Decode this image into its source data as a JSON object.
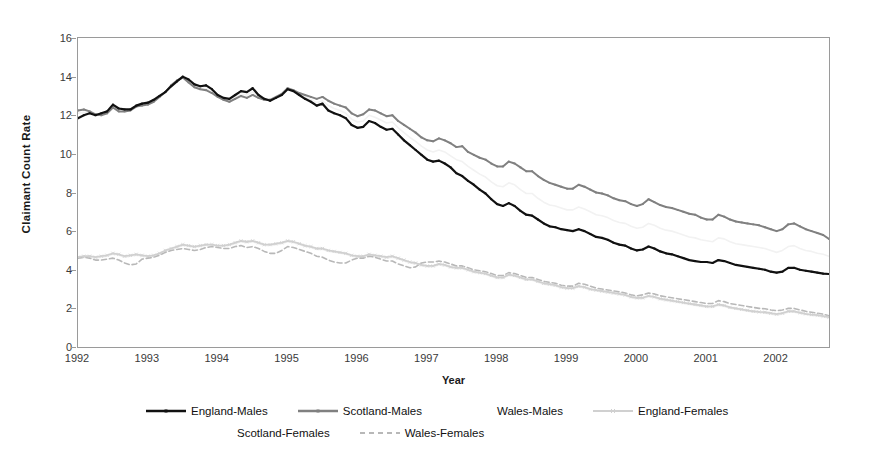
{
  "chart_data": {
    "type": "line",
    "title": "",
    "xlabel": "Year",
    "ylabel": "Claimant Count Rate",
    "ylim": [
      0,
      16
    ],
    "yticks": [
      0,
      2,
      4,
      6,
      8,
      10,
      12,
      14,
      16
    ],
    "xlim": [
      1992.0,
      2002.75
    ],
    "xticks": [
      1992,
      1993,
      1994,
      1995,
      1996,
      1997,
      1998,
      1999,
      2000,
      2001,
      2002
    ],
    "xtick_labels": [
      "1992",
      "1993",
      "1994",
      "1995",
      "1996",
      "1997",
      "1998",
      "1999",
      "2000",
      "2001",
      "2002"
    ],
    "grid": false,
    "legend_position": "bottom",
    "frequency": "monthly",
    "x_start": 1992.0,
    "x_step": 0.0833333,
    "series": [
      {
        "name": "England-Males",
        "color": "#111111",
        "width": 2.2,
        "dash": "none",
        "marker": "small-square",
        "values": [
          11.85,
          12.0,
          12.1,
          12.0,
          12.1,
          12.2,
          12.55,
          12.35,
          12.3,
          12.3,
          12.5,
          12.6,
          12.65,
          12.8,
          13.0,
          13.2,
          13.5,
          13.75,
          14.0,
          13.85,
          13.6,
          13.5,
          13.55,
          13.35,
          13.05,
          12.9,
          12.85,
          13.05,
          13.25,
          13.2,
          13.4,
          13.05,
          12.85,
          12.75,
          12.9,
          13.05,
          13.35,
          13.25,
          13.05,
          12.85,
          12.7,
          12.5,
          12.6,
          12.25,
          12.1,
          12.0,
          11.85,
          11.5,
          11.35,
          11.4,
          11.7,
          11.6,
          11.4,
          11.25,
          11.3,
          11.0,
          10.7,
          10.45,
          10.2,
          9.95,
          9.7,
          9.6,
          9.65,
          9.5,
          9.3,
          9.0,
          8.85,
          8.6,
          8.4,
          8.15,
          7.95,
          7.65,
          7.4,
          7.3,
          7.45,
          7.3,
          7.05,
          6.85,
          6.8,
          6.6,
          6.4,
          6.25,
          6.2,
          6.1,
          6.05,
          6.0,
          6.1,
          6.0,
          5.85,
          5.7,
          5.65,
          5.55,
          5.4,
          5.3,
          5.25,
          5.1,
          5.0,
          5.05,
          5.2,
          5.1,
          4.95,
          4.85,
          4.8,
          4.7,
          4.6,
          4.5,
          4.45,
          4.4,
          4.4,
          4.35,
          4.5,
          4.45,
          4.35,
          4.25,
          4.2,
          4.15,
          4.1,
          4.05,
          4.0,
          3.9,
          3.85,
          3.9,
          4.1,
          4.1,
          4.0,
          3.95,
          3.9,
          3.85,
          3.8,
          3.78,
          3.75,
          3.72,
          3.7
        ]
      },
      {
        "name": "Scotland-Males",
        "color": "#808080",
        "width": 2.0,
        "dash": "none",
        "marker": "small-square",
        "values": [
          12.25,
          12.3,
          12.2,
          12.05,
          12.0,
          12.1,
          12.4,
          12.2,
          12.2,
          12.25,
          12.45,
          12.5,
          12.55,
          12.7,
          12.95,
          13.2,
          13.55,
          13.8,
          13.95,
          13.7,
          13.45,
          13.35,
          13.3,
          13.15,
          12.95,
          12.8,
          12.7,
          12.85,
          13.0,
          12.9,
          13.05,
          12.9,
          12.8,
          12.8,
          12.95,
          13.1,
          13.4,
          13.3,
          13.15,
          13.05,
          12.95,
          12.85,
          12.95,
          12.75,
          12.6,
          12.5,
          12.4,
          12.1,
          11.95,
          12.05,
          12.3,
          12.25,
          12.1,
          11.95,
          12.0,
          11.7,
          11.5,
          11.3,
          11.1,
          10.85,
          10.7,
          10.65,
          10.8,
          10.7,
          10.55,
          10.35,
          10.4,
          10.1,
          9.95,
          9.8,
          9.7,
          9.5,
          9.35,
          9.35,
          9.6,
          9.5,
          9.3,
          9.1,
          9.1,
          8.85,
          8.65,
          8.5,
          8.4,
          8.3,
          8.2,
          8.2,
          8.4,
          8.3,
          8.15,
          8.0,
          7.95,
          7.85,
          7.7,
          7.6,
          7.55,
          7.4,
          7.3,
          7.4,
          7.65,
          7.5,
          7.35,
          7.25,
          7.2,
          7.1,
          7.0,
          6.9,
          6.85,
          6.7,
          6.6,
          6.6,
          6.85,
          6.75,
          6.6,
          6.5,
          6.45,
          6.4,
          6.35,
          6.3,
          6.2,
          6.1,
          6.0,
          6.1,
          6.35,
          6.4,
          6.25,
          6.1,
          6.0,
          5.9,
          5.8,
          5.6,
          5.45,
          5.3,
          5.25
        ]
      },
      {
        "name": "Wales-Males",
        "color": "#f2f2f2",
        "width": 1.6,
        "dash": "none",
        "marker": "none",
        "values": [
          12.1,
          12.15,
          12.1,
          12.0,
          12.05,
          12.15,
          12.45,
          12.3,
          12.25,
          12.3,
          12.5,
          12.55,
          12.6,
          12.75,
          12.95,
          13.2,
          13.5,
          13.75,
          13.95,
          13.8,
          13.55,
          13.4,
          13.4,
          13.25,
          13.0,
          12.85,
          12.8,
          12.95,
          13.1,
          13.05,
          13.2,
          12.95,
          12.8,
          12.75,
          12.9,
          13.05,
          13.35,
          13.25,
          13.1,
          12.95,
          12.8,
          12.65,
          12.75,
          12.5,
          12.35,
          12.25,
          12.1,
          11.8,
          11.65,
          11.7,
          12.0,
          11.9,
          11.75,
          11.6,
          11.65,
          11.35,
          11.1,
          10.85,
          10.65,
          10.4,
          10.2,
          10.1,
          10.2,
          10.1,
          9.9,
          9.7,
          9.6,
          9.35,
          9.15,
          8.95,
          8.8,
          8.55,
          8.35,
          8.3,
          8.5,
          8.4,
          8.15,
          7.95,
          7.95,
          7.7,
          7.5,
          7.35,
          7.3,
          7.2,
          7.1,
          7.1,
          7.25,
          7.15,
          7.0,
          6.85,
          6.8,
          6.7,
          6.55,
          6.45,
          6.4,
          6.25,
          6.15,
          6.2,
          6.4,
          6.3,
          6.15,
          6.05,
          6.0,
          5.9,
          5.8,
          5.7,
          5.65,
          5.55,
          5.5,
          5.45,
          5.65,
          5.6,
          5.45,
          5.35,
          5.3,
          5.25,
          5.2,
          5.15,
          5.1,
          5.0,
          4.9,
          5.0,
          5.2,
          5.25,
          5.1,
          5.0,
          4.95,
          4.85,
          4.8,
          4.7,
          4.6,
          4.5,
          4.45
        ]
      },
      {
        "name": "England-Females",
        "color": "#d0d0d0",
        "width": 1.8,
        "dash": "none",
        "marker": "small-x",
        "values": [
          4.65,
          4.7,
          4.7,
          4.65,
          4.7,
          4.75,
          4.85,
          4.8,
          4.7,
          4.75,
          4.8,
          4.75,
          4.7,
          4.75,
          4.85,
          5.0,
          5.1,
          5.2,
          5.3,
          5.25,
          5.2,
          5.25,
          5.3,
          5.3,
          5.25,
          5.25,
          5.3,
          5.4,
          5.5,
          5.45,
          5.5,
          5.4,
          5.3,
          5.3,
          5.35,
          5.4,
          5.5,
          5.45,
          5.35,
          5.25,
          5.2,
          5.1,
          5.1,
          5.0,
          4.95,
          4.9,
          4.85,
          4.75,
          4.7,
          4.7,
          4.8,
          4.75,
          4.7,
          4.65,
          4.7,
          4.6,
          4.5,
          4.4,
          4.35,
          4.25,
          4.2,
          4.2,
          4.3,
          4.25,
          4.15,
          4.1,
          4.1,
          4.0,
          3.9,
          3.85,
          3.8,
          3.7,
          3.6,
          3.6,
          3.75,
          3.7,
          3.6,
          3.5,
          3.5,
          3.4,
          3.3,
          3.25,
          3.2,
          3.1,
          3.05,
          3.05,
          3.15,
          3.1,
          3.0,
          2.95,
          2.9,
          2.85,
          2.8,
          2.75,
          2.7,
          2.6,
          2.55,
          2.55,
          2.65,
          2.6,
          2.5,
          2.45,
          2.4,
          2.35,
          2.3,
          2.25,
          2.2,
          2.15,
          2.1,
          2.1,
          2.2,
          2.15,
          2.05,
          2.0,
          1.95,
          1.9,
          1.85,
          1.82,
          1.8,
          1.75,
          1.7,
          1.75,
          1.85,
          1.85,
          1.78,
          1.72,
          1.68,
          1.65,
          1.6,
          1.55,
          1.5,
          1.45,
          1.4
        ]
      },
      {
        "name": "Scotland-Females",
        "color": "#f2f2f2",
        "width": 1.5,
        "dash": "none",
        "marker": "none",
        "values": [
          4.6,
          4.65,
          4.62,
          4.6,
          4.65,
          4.7,
          4.8,
          4.75,
          4.65,
          4.7,
          4.75,
          4.7,
          4.65,
          4.7,
          4.8,
          4.95,
          5.05,
          5.15,
          5.25,
          5.2,
          5.15,
          5.2,
          5.25,
          5.25,
          5.2,
          5.2,
          5.25,
          5.35,
          5.45,
          5.4,
          5.45,
          5.35,
          5.25,
          5.25,
          5.3,
          5.35,
          5.45,
          5.4,
          5.3,
          5.2,
          5.15,
          5.05,
          5.05,
          4.95,
          4.9,
          4.85,
          4.8,
          4.7,
          4.65,
          4.65,
          4.75,
          4.7,
          4.65,
          4.6,
          4.65,
          4.55,
          4.45,
          4.35,
          4.3,
          4.2,
          4.15,
          4.15,
          4.25,
          4.2,
          4.1,
          4.05,
          4.05,
          3.95,
          3.85,
          3.8,
          3.75,
          3.65,
          3.55,
          3.55,
          3.7,
          3.65,
          3.55,
          3.45,
          3.45,
          3.35,
          3.25,
          3.2,
          3.15,
          3.05,
          3.0,
          3.0,
          3.1,
          3.05,
          2.95,
          2.9,
          2.85,
          2.8,
          2.75,
          2.7,
          2.65,
          2.55,
          2.5,
          2.5,
          2.6,
          2.55,
          2.45,
          2.4,
          2.35,
          2.3,
          2.25,
          2.2,
          2.15,
          2.1,
          2.05,
          2.05,
          2.15,
          2.1,
          2.0,
          1.95,
          1.9,
          1.85,
          1.8,
          1.78,
          1.75,
          1.7,
          1.65,
          1.7,
          1.8,
          1.8,
          1.73,
          1.68,
          1.63,
          1.6,
          1.55,
          1.5,
          1.45,
          1.4,
          1.35
        ]
      },
      {
        "name": "Wales-Females",
        "color": "#b8b8b8",
        "width": 1.6,
        "dash": "5,3",
        "marker": "none",
        "values": [
          4.6,
          4.65,
          4.6,
          4.5,
          4.5,
          4.55,
          4.6,
          4.5,
          4.35,
          4.25,
          4.3,
          4.55,
          4.6,
          4.65,
          4.75,
          4.9,
          5.0,
          5.05,
          5.1,
          5.05,
          5.0,
          5.05,
          5.15,
          5.2,
          5.15,
          5.1,
          5.1,
          5.2,
          5.25,
          5.15,
          5.2,
          5.1,
          4.95,
          4.85,
          4.85,
          5.0,
          5.2,
          5.15,
          5.05,
          4.95,
          4.85,
          4.7,
          4.65,
          4.5,
          4.4,
          4.35,
          4.35,
          4.5,
          4.6,
          4.6,
          4.7,
          4.65,
          4.55,
          4.45,
          4.45,
          4.3,
          4.2,
          4.1,
          4.15,
          4.35,
          4.4,
          4.4,
          4.45,
          4.4,
          4.3,
          4.2,
          4.2,
          4.1,
          4.0,
          3.95,
          3.9,
          3.8,
          3.7,
          3.7,
          3.85,
          3.8,
          3.7,
          3.6,
          3.6,
          3.5,
          3.4,
          3.35,
          3.3,
          3.2,
          3.15,
          3.15,
          3.3,
          3.25,
          3.15,
          3.05,
          3.0,
          2.95,
          2.9,
          2.85,
          2.8,
          2.7,
          2.65,
          2.7,
          2.8,
          2.75,
          2.65,
          2.6,
          2.55,
          2.5,
          2.45,
          2.4,
          2.35,
          2.3,
          2.25,
          2.25,
          2.4,
          2.35,
          2.25,
          2.2,
          2.15,
          2.1,
          2.05,
          2.0,
          1.98,
          1.92,
          1.88,
          1.92,
          2.0,
          2.0,
          1.92,
          1.85,
          1.8,
          1.75,
          1.7,
          1.62,
          1.55,
          1.5,
          1.48
        ]
      }
    ]
  },
  "axes": {
    "ylabel": "Claimant Count Rate",
    "xlabel": "Year"
  },
  "legend": {
    "rows": [
      [
        {
          "label": "England-Males",
          "series": "England-Males"
        },
        {
          "label": "Scotland-Males",
          "series": "Scotland-Males"
        },
        {
          "label": "Wales-Males",
          "series": "Wales-Males"
        },
        {
          "label": "England-Females",
          "series": "England-Females"
        }
      ],
      [
        {
          "label": "Scotland-Females",
          "series": "Scotland-Females"
        },
        {
          "label": "Wales-Females",
          "series": "Wales-Females"
        }
      ]
    ]
  },
  "colors": {
    "england_males": "#111111",
    "scotland_males": "#808080",
    "wales_males": "#f2f2f2",
    "england_females": "#d0d0d0",
    "scotland_females": "#f2f2f2",
    "wales_females": "#b8b8b8",
    "frame": "#9a9a9a",
    "text": "#3a3a3a"
  }
}
